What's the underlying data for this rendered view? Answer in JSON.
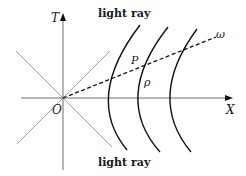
{
  "diagram": {
    "type": "spacetime-diagram",
    "axes": {
      "vertical_label": "T",
      "horizontal_label": "X",
      "origin_label": "O"
    },
    "light_ray_labels": {
      "top": "light ray",
      "bottom": "light ray"
    },
    "point_label": "P",
    "rho_label": "ρ",
    "omega_label": "ω",
    "colors": {
      "axes": "#7a7a7a",
      "light_rays": "#9a9a9a",
      "hyperbolas": "#111111",
      "dashed_line": "#111111",
      "text": "#1a1a1a"
    }
  }
}
